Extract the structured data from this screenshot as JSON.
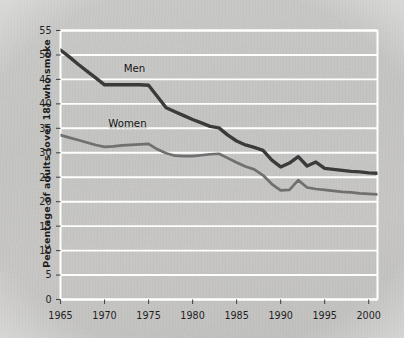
{
  "chart_data": {
    "type": "line",
    "title": "",
    "xlabel": "",
    "ylabel": "Percentage of adults (over 18) who smoke",
    "xlim": [
      1965,
      2001
    ],
    "ylim": [
      0,
      55
    ],
    "grid": true,
    "grid_axis": "y",
    "legend": "inline-labels",
    "x_ticks": [
      "1965",
      "1970",
      "1975",
      "1980",
      "1985",
      "1990",
      "1995",
      "2000"
    ],
    "y_ticks": [
      "0",
      "5",
      "10",
      "15",
      "20",
      "25",
      "30",
      "35",
      "40",
      "45",
      "50",
      "55"
    ],
    "series": [
      {
        "name": "Men",
        "color": "#3b3b3b",
        "label_x": 1973.4,
        "label_y": 46.6,
        "x": [
          1965,
          1966,
          1967,
          1968,
          1969,
          1970,
          1971,
          1972,
          1973,
          1974,
          1975,
          1976,
          1977,
          1978,
          1979,
          1980,
          1981,
          1982,
          1983,
          1984,
          1985,
          1986,
          1987,
          1988,
          1989,
          1990,
          1991,
          1992,
          1993,
          1994,
          1995,
          1996,
          1997,
          1998,
          1999,
          2000,
          2001
        ],
        "values": [
          51.0,
          49.6,
          48.1,
          46.7,
          45.3,
          43.9,
          43.9,
          43.9,
          43.9,
          43.9,
          43.8,
          41.5,
          39.2,
          38.4,
          37.6,
          36.8,
          36.1,
          35.4,
          35.1,
          33.6,
          32.4,
          31.6,
          31.1,
          30.5,
          28.5,
          27.1,
          27.9,
          29.2,
          27.3,
          28.1,
          26.8,
          26.6,
          26.4,
          26.2,
          26.1,
          25.9,
          25.8
        ]
      },
      {
        "name": "Women",
        "color": "#707070",
        "label_x": 1972.6,
        "label_y": 35.2,
        "x": [
          1965,
          1966,
          1967,
          1968,
          1969,
          1970,
          1971,
          1972,
          1973,
          1974,
          1975,
          1976,
          1977,
          1978,
          1979,
          1980,
          1981,
          1982,
          1983,
          1984,
          1985,
          1986,
          1987,
          1988,
          1989,
          1990,
          1991,
          1992,
          1993,
          1994,
          1995,
          1996,
          1997,
          1998,
          1999,
          2000,
          2001
        ],
        "values": [
          33.6,
          33.1,
          32.6,
          32.1,
          31.6,
          31.2,
          31.3,
          31.5,
          31.6,
          31.7,
          31.8,
          30.7,
          29.9,
          29.4,
          29.3,
          29.3,
          29.5,
          29.7,
          29.8,
          28.9,
          28.0,
          27.2,
          26.6,
          25.4,
          23.6,
          22.3,
          22.4,
          24.4,
          22.9,
          22.6,
          22.4,
          22.2,
          22.0,
          21.9,
          21.7,
          21.6,
          21.5
        ]
      }
    ]
  }
}
